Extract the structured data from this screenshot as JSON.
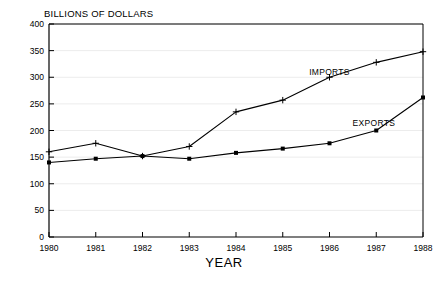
{
  "chart_data": {
    "type": "line",
    "title": "",
    "ylabel": "BILLIONS OF DOLLARS",
    "xlabel": "YEAR",
    "categories": [
      "1980",
      "1981",
      "1982",
      "1983",
      "1984",
      "1985",
      "1986",
      "1987",
      "1988"
    ],
    "x": [
      1980,
      1981,
      1982,
      1983,
      1984,
      1985,
      1986,
      1987,
      1988
    ],
    "xlim": [
      1980,
      1988
    ],
    "ylim": [
      0,
      400
    ],
    "yticks": [
      0,
      50,
      100,
      150,
      200,
      250,
      300,
      350,
      400
    ],
    "ytick_labels": [
      "0",
      "50",
      "100",
      "150",
      "200",
      "250",
      "300",
      "350",
      "400"
    ],
    "xticks": [
      1980,
      1981,
      1982,
      1983,
      1984,
      1985,
      1986,
      1987,
      1988
    ],
    "xtick_labels": [
      "1980",
      "1981",
      "1982",
      "1983",
      "1984",
      "1985",
      "1986",
      "1987",
      "1988"
    ],
    "grid": true,
    "grid_axis": "y",
    "legend": "inline-annotations",
    "series": [
      {
        "name": "IMPORTS",
        "marker": "plus",
        "color": "#000000",
        "values": [
          160,
          176,
          152,
          170,
          235,
          257,
          300,
          328,
          348
        ],
        "label_x": 1986.0,
        "label_y": 310
      },
      {
        "name": "EXPORTS",
        "marker": "square",
        "color": "#000000",
        "values": [
          140,
          147,
          152,
          147,
          158,
          166,
          176,
          200,
          262
        ],
        "label_x": 1986.95,
        "label_y": 214
      }
    ],
    "annotations": [
      {
        "text": "IMPORTS",
        "x": 1986.0,
        "y": 310
      },
      {
        "text": "EXPORTS",
        "x": 1986.95,
        "y": 214
      }
    ]
  },
  "colors": {
    "background": "#ffffff",
    "axis": "#000000",
    "grid": "#ececec",
    "line": "#000000",
    "text": "#000000"
  }
}
